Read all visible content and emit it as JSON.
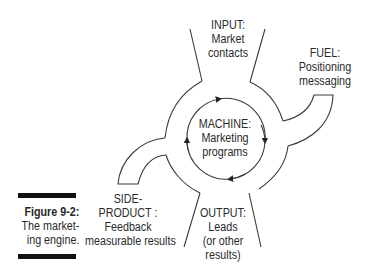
{
  "figure": {
    "number": "Figure 9-2:",
    "caption_lines": [
      "The market-",
      "ing engine."
    ]
  },
  "nodes": {
    "input": {
      "lines": [
        "INPUT:",
        "Market",
        "contacts"
      ]
    },
    "fuel": {
      "lines": [
        "FUEL:",
        "Positioning",
        "messaging"
      ]
    },
    "machine": {
      "lines": [
        "MACHINE:",
        "Marketing",
        "programs"
      ]
    },
    "side_product": {
      "lines": [
        "SIDE-",
        "PRODUCT :",
        "Feedback",
        "measurable results"
      ]
    },
    "output": {
      "lines": [
        "OUTPUT:",
        "Leads",
        "(or other",
        "results)"
      ]
    }
  },
  "colors": {
    "stroke": "#3a3a3a",
    "text": "#2a2a2a",
    "bar": "#111111"
  }
}
